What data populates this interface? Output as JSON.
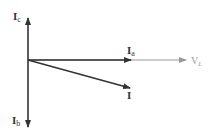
{
  "diagram": {
    "type": "phasor-diagram",
    "colors": {
      "dark_phasor": "#333333",
      "voltage_phasor": "#999999",
      "background": "#ffffff"
    },
    "phasors": [
      {
        "id": "Ic",
        "label_main": "I",
        "label_sub": "c",
        "direction": "up"
      },
      {
        "id": "Ib",
        "label_main": "I",
        "label_sub": "b",
        "direction": "down"
      },
      {
        "id": "Ia",
        "label_main": "I",
        "label_sub": "a",
        "direction": "right"
      },
      {
        "id": "VL",
        "label_main": "V",
        "label_sub": "L",
        "direction": "right"
      },
      {
        "id": "I",
        "label_main": "I",
        "label_sub": "",
        "direction": "down-right"
      }
    ]
  }
}
